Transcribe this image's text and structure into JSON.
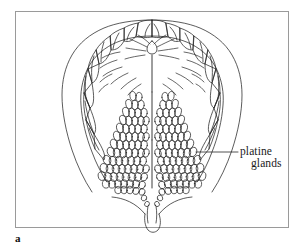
{
  "figure": {
    "caption_letter": "a",
    "frame": {
      "x": 15,
      "y": 11,
      "width": 274,
      "height": 217,
      "border_color": "#9a9a9a"
    },
    "background_color": "#ffffff",
    "ink_color": "#1a1a1a"
  },
  "labels": {
    "platine": "platine",
    "glands": "glands",
    "leader_line": {
      "from_x": 196,
      "to_x": 238,
      "y": 152
    }
  },
  "anatomy": {
    "structures": [
      "maxillary dental arch",
      "incisive papilla",
      "palatine rugae",
      "median palatine raphe",
      "palatine glands",
      "soft palate",
      "uvula"
    ],
    "teeth_per_quadrant": 8,
    "tooth_names": [
      "central incisor",
      "lateral incisor",
      "canine",
      "first premolar",
      "second premolar",
      "first molar",
      "second molar",
      "third molar"
    ],
    "rugae_count": 12,
    "gland_masses": 2
  }
}
